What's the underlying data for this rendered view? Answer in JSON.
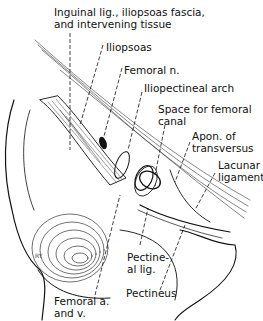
{
  "figure": {
    "signature": "RY",
    "labels": [
      {
        "id": "inguinal",
        "lines": [
          "Inguinal lig., iliopsoas fascia,",
          "and intervening tissue"
        ]
      },
      {
        "id": "iliopsoas",
        "lines": [
          "Iliopsoas"
        ]
      },
      {
        "id": "femoral-n",
        "lines": [
          "Femoral n."
        ]
      },
      {
        "id": "iliopectineal",
        "lines": [
          "Iliopectineal arch"
        ]
      },
      {
        "id": "femoral-canal",
        "lines": [
          "Space for femoral",
          "canal"
        ]
      },
      {
        "id": "apon",
        "lines": [
          "Apon. of",
          "transversus"
        ]
      },
      {
        "id": "lacunar",
        "lines": [
          "Lacunar",
          "ligament"
        ]
      },
      {
        "id": "pectineal",
        "lines": [
          "Pectine-",
          "al lig."
        ]
      },
      {
        "id": "pectineus",
        "lines": [
          "Pectineus"
        ]
      },
      {
        "id": "femoral-av",
        "lines": [
          "Femoral a.",
          "and v."
        ]
      }
    ]
  }
}
